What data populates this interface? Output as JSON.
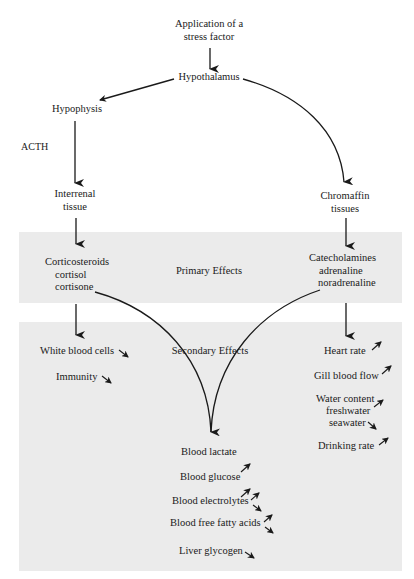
{
  "diagram": {
    "stimulus": [
      "Application of a",
      "stress factor"
    ],
    "hypothalamus": "Hypothalamus",
    "hypophysis": "Hypophysis",
    "acth": "ACTH",
    "interrenal": [
      "Interrenal",
      "tissue"
    ],
    "chromaffin": [
      "Chromaffin",
      "tissues"
    ],
    "primary_band": {
      "label": "Primary Effects",
      "left": [
        "Corticosteroids",
        "cortisol",
        "cortisone"
      ],
      "right": [
        "Catecholamines",
        "adrenaline",
        "noradrenaline"
      ]
    },
    "secondary_band": {
      "label": "Secondary Effects",
      "left_items": [
        {
          "label": "White blood cells",
          "trend": "down"
        },
        {
          "label": "Immunity",
          "trend": "down"
        }
      ],
      "center_items": [
        {
          "label": "Blood lactate",
          "trend": "up"
        },
        {
          "label": "Blood glucose",
          "trend": "up"
        },
        {
          "label": "Blood electrolytes",
          "trend": "up-down"
        },
        {
          "label": "Blood free fatty acids",
          "trend": "up-down"
        },
        {
          "label": "Liver glycogen",
          "trend": "down"
        }
      ],
      "right_items": [
        {
          "label": "Heart rate",
          "trend": "up"
        },
        {
          "label": "Gill blood flow",
          "trend": "up"
        },
        {
          "label": "Water content",
          "trend": ""
        },
        {
          "label": "freshwater",
          "trend": "up"
        },
        {
          "label": "seawater",
          "trend": "down"
        },
        {
          "label": "Drinking rate",
          "trend": "up"
        }
      ]
    },
    "colors": {
      "band": "#ebebeb",
      "ink": "#1a1a1a",
      "background": "#ffffff"
    }
  }
}
